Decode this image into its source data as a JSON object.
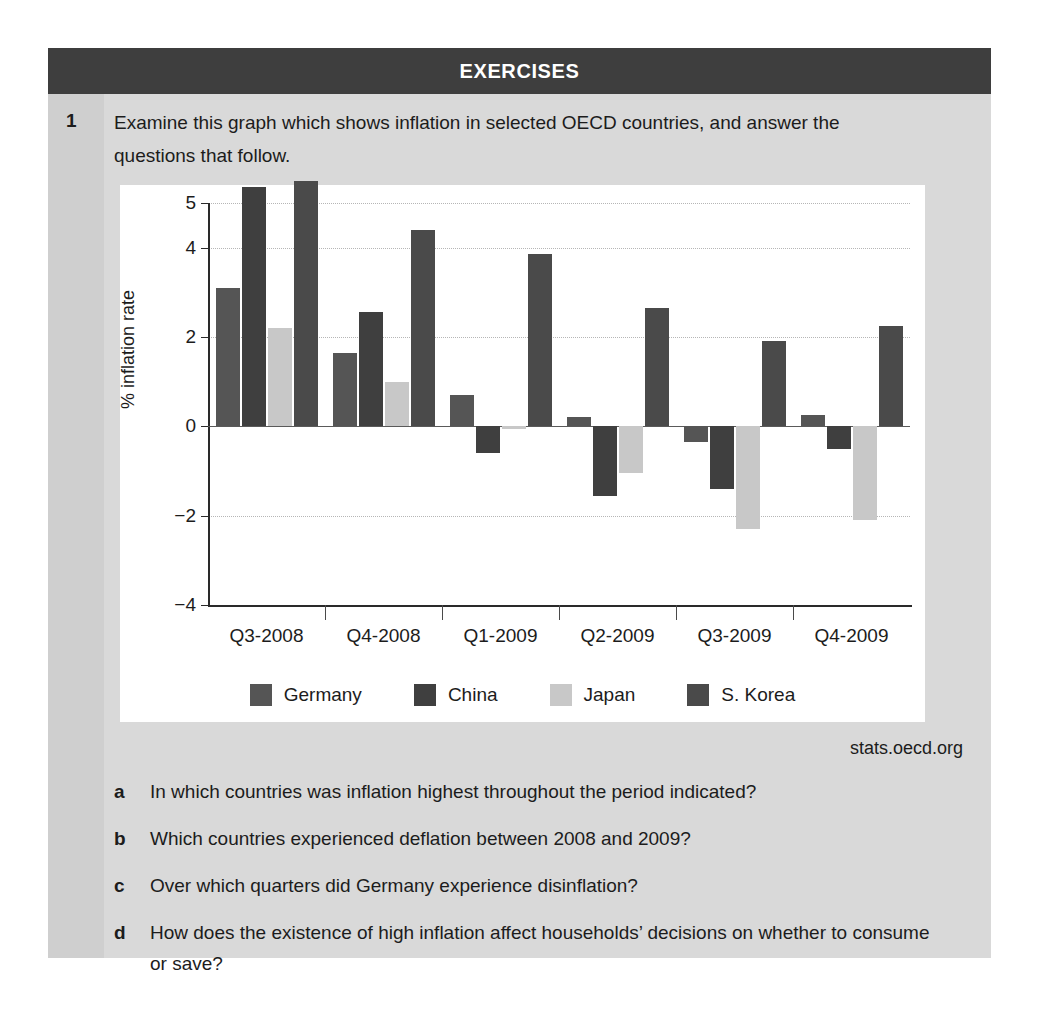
{
  "header": {
    "title": "EXERCISES"
  },
  "exercise": {
    "number": "1",
    "intro": "Examine this graph which shows inflation in selected OECD countries,  and answer the questions that follow.",
    "source": "stats.oecd.org"
  },
  "questions": [
    {
      "marker": "a",
      "text": "In which countries was inflation highest throughout the period indicated?"
    },
    {
      "marker": "b",
      "text": "Which countries experienced deflation between 2008 and 2009?"
    },
    {
      "marker": "c",
      "text": "Over which quarters did Germany experience disinflation?"
    },
    {
      "marker": "d",
      "text": "How does the existence of high inflation affect households’ decisions on whether to consume or save?"
    }
  ],
  "colors": {
    "germany": "#555555",
    "china": "#3f3f3f",
    "japan": "#c8c8c8",
    "skorea": "#4a4a4a",
    "header_bar": "#3e3e3e",
    "box_background": "#d9d9d9",
    "gutter": "#cfcfcf",
    "panel": "#ffffff",
    "gridline": "#b6b6b6",
    "axis": "#2a2a2a"
  },
  "chart_data": {
    "type": "bar",
    "title": "",
    "xlabel": "",
    "ylabel": "% inflation rate",
    "ylim": [
      -4,
      5
    ],
    "yticks": [
      5,
      4,
      2,
      0,
      -2,
      -4
    ],
    "ytick_labels": [
      "5",
      "4",
      "2",
      "0",
      "−2",
      "−4"
    ],
    "gridlines": [
      5,
      4,
      2,
      -2
    ],
    "grid": true,
    "legend_position": "bottom",
    "categories": [
      "Q3-2008",
      "Q4-2008",
      "Q1-2009",
      "Q2-2009",
      "Q3-2009",
      "Q4-2009"
    ],
    "series": [
      {
        "name": "Germany",
        "color": "#555555",
        "values": [
          3.1,
          1.65,
          0.7,
          0.2,
          -0.35,
          0.25
        ]
      },
      {
        "name": "China",
        "color": "#3f3f3f",
        "values": [
          5.35,
          2.55,
          -0.6,
          -1.55,
          -1.4,
          -0.5
        ]
      },
      {
        "name": "Japan",
        "color": "#c8c8c8",
        "values": [
          2.2,
          1.0,
          -0.05,
          -1.05,
          -2.3,
          -2.1
        ]
      },
      {
        "name": "S. Korea",
        "color": "#4a4a4a",
        "values": [
          5.5,
          4.4,
          3.85,
          2.65,
          1.9,
          2.25
        ]
      }
    ]
  }
}
